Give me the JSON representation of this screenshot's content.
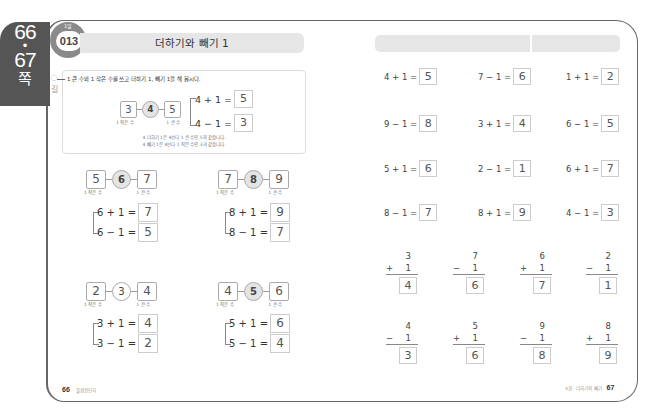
{
  "side_tab": {
    "page_start": "66",
    "dot": "•",
    "page_end": "67",
    "suffix": "쪽"
  },
  "lesson": {
    "day": "1일",
    "number": "013",
    "title": "더하기와 빼기 1"
  },
  "hint": {
    "label": "길"
  },
  "example": {
    "instruction": "1 큰 수와 1 작은 수를 쓰고 더하기 1, 빼기 1을 해 봅시다.",
    "chain": {
      "smaller": "3",
      "center": "4",
      "larger": "5"
    },
    "labels": {
      "smaller": "1 작은 수",
      "larger": "1 큰 수"
    },
    "add": {
      "expr": "4 + 1 =",
      "answer": "5"
    },
    "sub": {
      "expr": "4 − 1 =",
      "answer": "3"
    },
    "notes": [
      "4 더하기 1은 4보다 1 큰 수인 5와 같습니다.",
      "4 빼기 1은 4보다 1 작은 수인 3과 같습니다."
    ]
  },
  "practice": [
    {
      "smaller": "5",
      "center": "6",
      "larger": "7",
      "add_expr": "6 + 1 =",
      "add_ans": "7",
      "sub_expr": "6 − 1 =",
      "sub_ans": "5"
    },
    {
      "smaller": "7",
      "center": "8",
      "larger": "9",
      "add_expr": "8 + 1 =",
      "add_ans": "9",
      "sub_expr": "8 − 1 =",
      "sub_ans": "7"
    },
    {
      "smaller": "2",
      "center": "3",
      "larger": "4",
      "add_expr": "3 + 1 =",
      "add_ans": "4",
      "sub_expr": "3 − 1 =",
      "sub_ans": "2"
    },
    {
      "smaller": "4",
      "center": "5",
      "larger": "6",
      "add_expr": "5 + 1 =",
      "add_ans": "6",
      "sub_expr": "5 − 1 =",
      "sub_ans": "4"
    }
  ],
  "practice_labels": {
    "smaller": "1 작은 수",
    "larger": "1 큰 수"
  },
  "horizontal": [
    {
      "expr": "4 + 1 =",
      "ans": "5"
    },
    {
      "expr": "7 − 1 =",
      "ans": "6"
    },
    {
      "expr": "1 + 1 =",
      "ans": "2"
    },
    {
      "expr": "9 − 1 =",
      "ans": "8"
    },
    {
      "expr": "3 + 1 =",
      "ans": "4"
    },
    {
      "expr": "6 − 1 =",
      "ans": "5"
    },
    {
      "expr": "5 + 1 =",
      "ans": "6"
    },
    {
      "expr": "2 − 1 =",
      "ans": "1"
    },
    {
      "expr": "6 + 1 =",
      "ans": "7"
    },
    {
      "expr": "8 − 1 =",
      "ans": "7"
    },
    {
      "expr": "8 + 1 =",
      "ans": "9"
    },
    {
      "expr": "4 − 1 =",
      "ans": "3"
    }
  ],
  "vertical": [
    {
      "top": "3",
      "op": "+",
      "bottom": "1",
      "ans": "4"
    },
    {
      "top": "7",
      "op": "−",
      "bottom": "1",
      "ans": "6"
    },
    {
      "top": "6",
      "op": "+",
      "bottom": "1",
      "ans": "7"
    },
    {
      "top": "2",
      "op": "−",
      "bottom": "1",
      "ans": "1"
    },
    {
      "top": "4",
      "op": "−",
      "bottom": "1",
      "ans": "3"
    },
    {
      "top": "5",
      "op": "+",
      "bottom": "1",
      "ans": "6"
    },
    {
      "top": "9",
      "op": "−",
      "bottom": "1",
      "ans": "8"
    },
    {
      "top": "8",
      "op": "+",
      "bottom": "1",
      "ans": "9"
    }
  ],
  "footer": {
    "left_page": "66",
    "left_text": "풀셈전단지",
    "right_text": "4권 · 더하기와 빼기",
    "right_page": "67"
  }
}
